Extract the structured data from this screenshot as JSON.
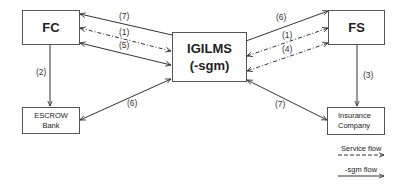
{
  "diagram": {
    "nodes": {
      "fc": {
        "label": "FC"
      },
      "igilms": {
        "line1": "IGILMS",
        "line2": "(-sgm)"
      },
      "fs": {
        "label": "FS"
      },
      "escrow": {
        "line1": "ESCROW",
        "line2": "Bank"
      },
      "insurance": {
        "line1": "Insurance",
        "line2": "Company"
      }
    },
    "edges": {
      "fc_igilms_7": {
        "label": "(7)",
        "style": "solid",
        "from": "IGILMS",
        "to": "FC"
      },
      "fc_igilms_1": {
        "label": "(1)",
        "style": "dashed",
        "from": "FC",
        "to": "IGILMS",
        "bidirectional": true
      },
      "fc_igilms_5": {
        "label": "(5)",
        "style": "solid",
        "from": "FC",
        "to": "IGILMS",
        "bidirectional": true
      },
      "fc_escrow_2": {
        "label": "(2)",
        "style": "solid",
        "from": "FC",
        "to": "ESCROW Bank"
      },
      "igilms_escrow_6": {
        "label": "(6)",
        "style": "solid",
        "from": "IGILMS",
        "to": "ESCROW Bank",
        "bidirectional": true
      },
      "igilms_fs_6": {
        "label": "(6)",
        "style": "solid",
        "from": "IGILMS",
        "to": "FS"
      },
      "igilms_fs_1": {
        "label": "(1)",
        "style": "dashed",
        "from": "IGILMS",
        "to": "FS",
        "bidirectional": true
      },
      "igilms_fs_4": {
        "label": "(4)",
        "style": "dashed",
        "from": "FS",
        "to": "IGILMS",
        "bidirectional": true
      },
      "fs_insurance_3": {
        "label": "(3)",
        "style": "solid",
        "from": "FS",
        "to": "Insurance Company"
      },
      "igilms_insurance_7": {
        "label": "(7)",
        "style": "solid",
        "from": "IGILMS",
        "to": "Insurance Company",
        "bidirectional": true
      }
    },
    "legend": {
      "service_flow": "Service flow",
      "sgm_flow": "-sgm flow"
    },
    "colors": {
      "line": "#333333",
      "box_border": "#555555",
      "text": "#222222"
    }
  }
}
